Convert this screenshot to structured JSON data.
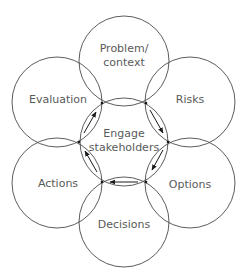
{
  "diagram": {
    "center": {
      "label_line1": "Engage",
      "label_line2": "stakeholders"
    },
    "nodes": [
      {
        "id": "problem",
        "label_line1": "Problem/",
        "label_line2": "context"
      },
      {
        "id": "risks",
        "label": "Risks"
      },
      {
        "id": "options",
        "label": "Options"
      },
      {
        "id": "decisions",
        "label": "Decisions"
      },
      {
        "id": "actions",
        "label": "Actions"
      },
      {
        "id": "evaluation",
        "label": "Evaluation"
      }
    ],
    "cycle_direction": "clockwise",
    "colors": {
      "stroke": "#4a4a4a",
      "text": "#5a5a5a",
      "arrow": "#1a1a1a"
    }
  }
}
